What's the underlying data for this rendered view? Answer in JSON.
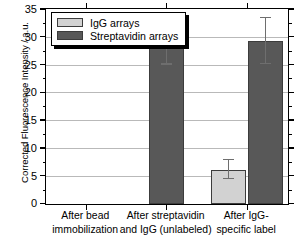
{
  "chart_data": {
    "type": "bar",
    "title": "",
    "xlabel": "",
    "ylabel": "Corrected Fluorescence Intensity / a.u.",
    "ylim": [
      0,
      35
    ],
    "ytick_values": [
      0,
      5,
      10,
      15,
      20,
      25,
      30,
      35
    ],
    "ytick_labels": [
      "0",
      "5",
      "10",
      "15",
      "20",
      "25",
      "30",
      "35"
    ],
    "grid": "horizontal",
    "legend_position": "upper left",
    "categories": [
      "After bead immobilization",
      "After streptavidin and IgG (unlabeled)",
      "After IgG-specific label"
    ],
    "category_lines": [
      [
        "After bead",
        "immobilization"
      ],
      [
        "After streptavidin",
        "and IgG (unlabeled)"
      ],
      [
        "After IgG-",
        "specific label"
      ]
    ],
    "series": [
      {
        "name": "IgG arrays",
        "color": "#d2d2d2",
        "values": [
          0,
          0,
          6.2
        ],
        "errors": [
          0,
          0,
          1.8
        ]
      },
      {
        "name": "Streptavidin arrays",
        "color": "#585858",
        "values": [
          0,
          29.2,
          29.3
        ],
        "errors": [
          0,
          4.2,
          4.2
        ]
      }
    ]
  },
  "legend": {
    "entries": [
      {
        "label": "IgG arrays",
        "color": "#d2d2d2"
      },
      {
        "label": "Streptavidin arrays",
        "color": "#585858"
      }
    ]
  },
  "axis": {
    "y_title": "Corrected Fluorescence Intensity / a.u.",
    "y_ticks": [
      "35",
      "30",
      "25",
      "20",
      "15",
      "10",
      "5",
      "0"
    ]
  }
}
